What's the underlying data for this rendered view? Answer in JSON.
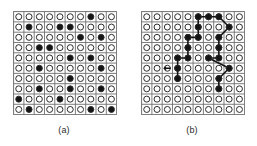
{
  "figure": {
    "title": "",
    "background_color": "#ffffff",
    "grid_line_color": "#8c8c8c",
    "cell_outline_color": "#6e6e6e",
    "circle_outline_color": "#2b2b2b",
    "circle_fill_empty": "#ffffff",
    "circle_fill_filled": "#141414",
    "path_color": "#141414"
  },
  "panels": [
    {
      "id": "a",
      "caption": "(a)",
      "grid": {
        "rows": 10,
        "cols": 10,
        "cell_size": 10.3,
        "circle_radius": 3.0,
        "circle_stroke": 1.0
      },
      "filled_cells": [
        [
          1,
          8
        ],
        [
          2,
          2
        ],
        [
          2,
          5
        ],
        [
          2,
          6
        ],
        [
          3,
          7
        ],
        [
          3,
          9
        ],
        [
          4,
          3
        ],
        [
          4,
          4
        ],
        [
          5,
          6
        ],
        [
          5,
          8
        ],
        [
          6,
          3
        ],
        [
          6,
          9
        ],
        [
          7,
          6
        ],
        [
          8,
          3
        ],
        [
          8,
          6
        ],
        [
          8,
          9
        ],
        [
          9,
          1
        ],
        [
          9,
          5
        ],
        [
          10,
          2
        ],
        [
          10,
          8
        ],
        [
          10,
          10
        ]
      ],
      "filled_count": 21,
      "path": [],
      "arrow": null
    },
    {
      "id": "b",
      "caption": "(b)",
      "grid": {
        "rows": 10,
        "cols": 10,
        "cell_size": 10.3,
        "circle_radius": 3.0,
        "circle_stroke": 1.0
      },
      "filled_cells": [
        [
          1,
          6
        ],
        [
          1,
          7
        ],
        [
          1,
          8
        ],
        [
          2,
          6
        ],
        [
          2,
          9
        ],
        [
          3,
          5
        ],
        [
          3,
          6
        ],
        [
          3,
          8
        ],
        [
          4,
          5
        ],
        [
          4,
          8
        ],
        [
          5,
          4
        ],
        [
          5,
          5
        ],
        [
          5,
          7
        ],
        [
          5,
          8
        ],
        [
          6,
          4
        ],
        [
          6,
          9
        ],
        [
          7,
          4
        ],
        [
          7,
          8
        ],
        [
          8,
          8
        ]
      ],
      "filled_count": 19,
      "path": [
        [
          1,
          6
        ],
        [
          1,
          7
        ],
        [
          1,
          8
        ],
        [
          2,
          9
        ],
        [
          3,
          8
        ],
        [
          4,
          8
        ],
        [
          5,
          8
        ],
        [
          5,
          7
        ],
        [
          6,
          9
        ],
        [
          7,
          8
        ],
        [
          8,
          8
        ]
      ],
      "path_branch": [
        [
          1,
          6
        ],
        [
          2,
          6
        ],
        [
          3,
          6
        ],
        [
          3,
          5
        ],
        [
          4,
          5
        ],
        [
          5,
          5
        ],
        [
          5,
          4
        ],
        [
          6,
          4
        ],
        [
          7,
          4
        ]
      ],
      "arrow": {
        "row": 6,
        "col": 3,
        "direction": "left",
        "label": ""
      }
    }
  ]
}
